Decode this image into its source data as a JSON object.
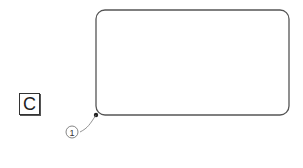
{
  "figure": {
    "label": "C",
    "reference_numerals": [
      {
        "id": "1",
        "text": "1",
        "points_to": "bottom-left corner of rounded rectangle"
      }
    ],
    "shape": {
      "type": "rounded-rectangle",
      "x": 96,
      "y": 10,
      "width": 193,
      "height": 105,
      "corner_radius": 9
    }
  },
  "colors": {
    "line": "#555555",
    "background": "#ffffff"
  }
}
